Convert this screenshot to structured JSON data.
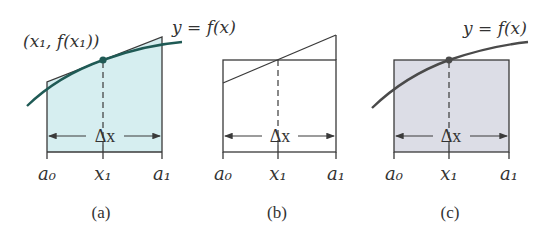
{
  "figure": {
    "panels": [
      {
        "id": "a",
        "caption": "(a)",
        "description": "Trapezoid approximation with tangent line at midpoint; shaded region",
        "point_label": "(x₁, f(x₁))",
        "curve_label": "y = f(x)",
        "delta_label": "Δx",
        "ticks": {
          "left": "a₀",
          "mid": "x₁",
          "right": "a₁"
        },
        "fill_color": "#d6eef0",
        "curve_color": "#1f5a55"
      },
      {
        "id": "b",
        "caption": "(b)",
        "description": "Trapezoid compared to rectangle of equal area (unshaded)",
        "delta_label": "Δx",
        "ticks": {
          "left": "a₀",
          "mid": "x₁",
          "right": "a₁"
        }
      },
      {
        "id": "c",
        "caption": "(c)",
        "description": "Midpoint rectangle under the curve; shaded region",
        "curve_label": "y = f(x)",
        "delta_label": "Δx",
        "ticks": {
          "left": "a₀",
          "mid": "x₁",
          "right": "a₁"
        },
        "fill_color": "#dcdde6",
        "curve_color": "#4a4a4a"
      }
    ]
  }
}
